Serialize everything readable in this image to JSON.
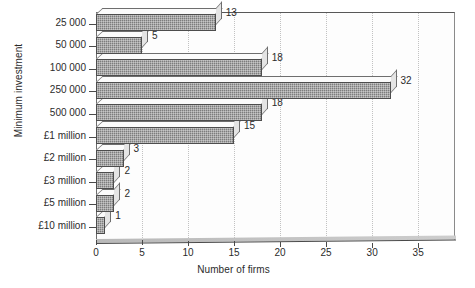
{
  "chart_data": {
    "type": "bar",
    "orientation": "horizontal",
    "title": "",
    "xlabel": "Number of firms",
    "ylabel": "Minimum investment",
    "categories": [
      "25 000",
      "50 000",
      "100 000",
      "250 000",
      "500 000",
      "£1 million",
      "£2 million",
      "£3 million",
      "£5 million",
      "£10 million"
    ],
    "values": [
      13,
      5,
      18,
      32,
      18,
      15,
      3,
      2,
      2,
      1
    ],
    "data_labels": [
      "13",
      "5",
      "18",
      "32",
      "18",
      "15",
      "3",
      "2",
      "2",
      "1"
    ],
    "xlim": [
      0,
      39
    ],
    "xticks": [
      0,
      5,
      10,
      15,
      20,
      25,
      30,
      35
    ],
    "xtick_labels": [
      "0",
      "5",
      "10",
      "15",
      "20",
      "25",
      "30",
      "35"
    ],
    "grid": "vertical-dotted",
    "legend": "none",
    "bar_color": "#7d7d7d",
    "bar_edge_color": "#4d4d4d",
    "grid_color": "#c2c2c2",
    "axis_color": "#4a4a4a",
    "background": "#ffffff"
  }
}
